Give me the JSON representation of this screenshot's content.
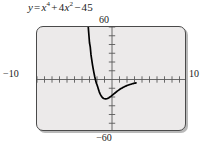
{
  "figure": {
    "caption_parts": {
      "lhs": "y",
      "equals": "=",
      "term1_base": "x",
      "term1_exp": "4",
      "plus": "+",
      "term2_coef": "4",
      "term2_base": "x",
      "term2_exp": "2",
      "minus": "−",
      "term3": "45"
    },
    "caption_plain": "y = x⁴ + 4x² − 45"
  },
  "axis_labels": {
    "y_max": "60",
    "y_min": "−60",
    "x_min": "−10",
    "x_max": "10"
  },
  "colors": {
    "plot_background": "#eceaea",
    "frame_border": "#4a4a4a",
    "frame_shadow": "#b9b9b9",
    "axis": "#5a5a5a",
    "curve": "#000000",
    "text": "#1a1a1a",
    "page_background": "#ffffff"
  },
  "chart_data": {
    "type": "line",
    "xlabel": "",
    "ylabel": "",
    "xlim": [
      -10,
      10
    ],
    "ylim": [
      -60,
      60
    ],
    "grid": false,
    "legend": "none",
    "x_tick_step": 1,
    "y_tick_step": 10,
    "x_ticks": [
      -10,
      -9,
      -8,
      -7,
      -6,
      -5,
      -4,
      -3,
      -2,
      -1,
      0,
      1,
      2,
      3,
      4,
      5,
      6,
      7,
      8,
      9,
      10
    ],
    "y_ticks": [
      -60,
      -50,
      -40,
      -30,
      -20,
      -10,
      0,
      10,
      20,
      30,
      40,
      50,
      60
    ],
    "x_tick_labels": [
      "−10",
      "10"
    ],
    "y_tick_labels": [
      "−60",
      "60"
    ],
    "function": "x^4 + 4*x^2 - 45",
    "vertex": [
      0,
      -45
    ],
    "x_intercepts": [
      -2.236,
      2.236
    ],
    "y_intercept": -45,
    "series": [
      {
        "name": "y = x⁴ + 4x² − 45",
        "x": [
          -3.2,
          -3.1,
          -3.0,
          -2.9,
          -2.8,
          -2.7,
          -2.6,
          -2.5,
          -2.4,
          -2.3,
          -2.2,
          -2.1,
          -2.0,
          -1.9,
          -1.8,
          -1.7,
          -1.6,
          -1.5,
          -1.4,
          -1.3,
          -1.2,
          -1.1,
          -1.0,
          -0.9,
          -0.8,
          -0.7,
          -0.6,
          -0.5,
          -0.4,
          -0.3,
          -0.2,
          -0.1,
          0.0,
          0.1,
          0.2,
          0.3,
          0.4,
          0.5,
          0.6,
          0.7,
          0.8,
          0.9,
          1.0,
          1.1,
          1.2,
          1.3,
          1.4,
          1.5,
          1.6,
          1.7,
          1.8,
          1.9,
          2.0,
          2.1,
          2.2,
          2.3,
          2.4,
          2.5,
          2.6,
          2.7,
          2.8,
          2.9,
          3.0,
          3.1,
          3.2
        ],
        "y": [
          63.8,
          52.8,
          42.0,
          37.3,
          28.1,
          22.3,
          16.8,
          11.8,
          7.2,
          3.1,
          -0.6,
          -3.9,
          -6.0,
          -8.7,
          -11.5,
          -14.1,
          -16.2,
          -17.9,
          -19.3,
          -20.4,
          -21.2,
          -21.7,
          -22.0,
          -22.1,
          -22.1,
          -22.0,
          -21.7,
          -21.3,
          -20.8,
          -20.2,
          -19.6,
          -18.9,
          -18.2,
          -17.5,
          -16.8,
          -16.1,
          -15.4,
          -14.7,
          -14.0,
          -13.3,
          -12.7,
          -12.1,
          -11.5,
          -10.9,
          -10.4,
          -9.9,
          -9.4,
          -8.9,
          -8.5,
          -8.1,
          -7.7,
          -7.3,
          -6.9,
          -6.6,
          -6.3,
          -6.0,
          -5.7,
          -5.4,
          -5.2,
          -4.9,
          -4.7,
          -4.5,
          -4.3,
          -4.1,
          -3.9
        ]
      }
    ],
    "note": "Curve enters frame at top (y=60) near x=±3.15, dips to minimum y=−45 at x=0, crossing x-axis at x=±√5."
  }
}
